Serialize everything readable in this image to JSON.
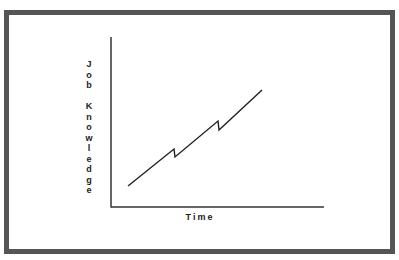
{
  "diagram": {
    "y_axis_label": "Job Knowledge",
    "y_axis_letters": [
      "J",
      "o",
      "b",
      " ",
      "K",
      "n",
      "o",
      "w",
      "l",
      "e",
      "d",
      "g",
      "e"
    ],
    "x_axis_label": "Time",
    "colors": {
      "frame": "#555555",
      "line": "#222222",
      "background": "#ffffff"
    }
  },
  "chart_data": {
    "type": "line",
    "title": "",
    "xlabel": "Time",
    "ylabel": "Job Knowledge",
    "points_px": [
      [
        128,
        186
      ],
      [
        174,
        149
      ],
      [
        175,
        157
      ],
      [
        218,
        121
      ],
      [
        219,
        130
      ],
      [
        262,
        90
      ]
    ],
    "grid": false,
    "ticks": false
  }
}
